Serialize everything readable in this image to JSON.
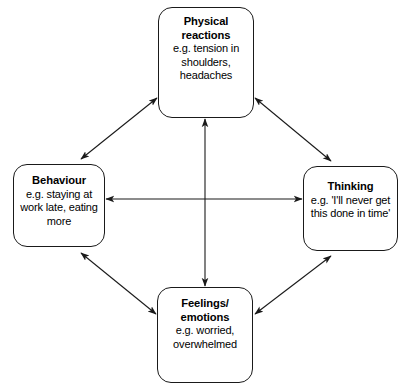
{
  "diagram": {
    "stroke_color": "#1a1a1a",
    "background_color": "#ffffff",
    "nodes": [
      {
        "id": "physical",
        "title": "Physical reactions",
        "title_lines": [
          "Physical",
          "reactions"
        ],
        "example": "e.g. tension in shoulders, headaches",
        "example_lines": [
          "e.g. tension in",
          "shoulders,",
          "headaches"
        ],
        "position": "top"
      },
      {
        "id": "behaviour",
        "title": "Behaviour",
        "title_lines": [
          "Behaviour"
        ],
        "example": "e.g. staying at work late, eating more",
        "example_lines": [
          "e.g. staying at",
          "work late, eating",
          "more"
        ],
        "position": "left"
      },
      {
        "id": "thinking",
        "title": "Thinking",
        "title_lines": [
          "Thinking"
        ],
        "example": "e.g. 'I'll never get this done in time'",
        "example_lines": [
          "e.g. 'I'll never get",
          "this done in time'"
        ],
        "position": "right"
      },
      {
        "id": "feelings",
        "title": "Feelings/ emotions",
        "title_lines": [
          "Feelings/",
          "emotions"
        ],
        "example": "e.g. worried, overwhelmed",
        "example_lines": [
          "e.g. worried,",
          "overwhelmed"
        ],
        "position": "bottom"
      }
    ],
    "connectors": [
      {
        "id": "behaviour-physical",
        "from": "behaviour",
        "to": "physical",
        "style": "double-headed"
      },
      {
        "id": "physical-thinking",
        "from": "physical",
        "to": "thinking",
        "style": "double-headed"
      },
      {
        "id": "behaviour-feelings",
        "from": "behaviour",
        "to": "feelings",
        "style": "double-headed"
      },
      {
        "id": "feelings-thinking",
        "from": "feelings",
        "to": "thinking",
        "style": "double-headed"
      },
      {
        "id": "behaviour-thinking",
        "from": "behaviour",
        "to": "thinking",
        "style": "double-headed"
      },
      {
        "id": "physical-feelings",
        "from": "physical",
        "to": "feelings",
        "style": "double-headed"
      }
    ]
  }
}
